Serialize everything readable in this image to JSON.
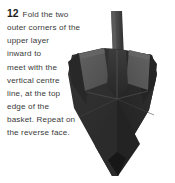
{
  "step": {
    "number": "12",
    "lines": [
      "Fold the two",
      "outer corners of the",
      "upper layer",
      "inward to",
      "meet with the",
      "vertical centre",
      "line, at the top",
      "edge of the",
      "basket. Repeat on",
      "the reverse face."
    ],
    "full_text": "12 Fold the two outer corners of the upper layer inward to meet with the vertical centre line, at the top edge of the basket. Repeat on the reverse face."
  },
  "photo": {
    "subject": "origami-basket-model",
    "colors": {
      "background": "#ffffff",
      "body_dark": "#2e2e2e",
      "body_darker": "#1f1f1f",
      "body_mid": "#3a3a3a",
      "flap_gray": "#565656",
      "flap_gray_light": "#636363",
      "handle_gray": "#4a4a4a",
      "shadow": "#141414",
      "crease": "#5a5a5a"
    }
  },
  "text_color": "#3a3a3a",
  "number_color": "#1b1b1b"
}
